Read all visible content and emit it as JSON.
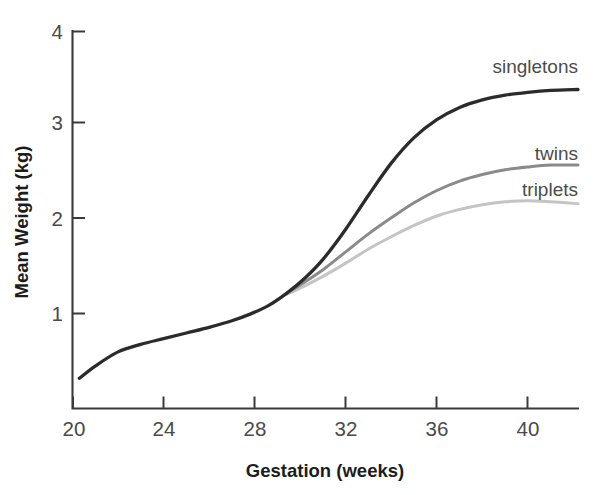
{
  "chart_data": {
    "type": "line",
    "title": "",
    "xlabel": "Gestation (weeks)",
    "ylabel": "Mean Weight (kg)",
    "xlim": [
      20,
      42.2
    ],
    "ylim": [
      0,
      4
    ],
    "grid": false,
    "legend_position": "inline-right-end-of-line",
    "xticks": [
      20,
      24,
      28,
      32,
      36,
      40
    ],
    "xtick_labels": [
      "20",
      "24",
      "28",
      "32",
      "36",
      "40"
    ],
    "yticks": [
      1,
      2,
      3,
      4
    ],
    "ytick_labels": [
      "1",
      "2",
      "3",
      "4"
    ],
    "series": [
      {
        "name": "singletons",
        "color": "#2b2b2b",
        "stroke_width": 3.3,
        "label": "singletons",
        "x": [
          20.3,
          21,
          22,
          23,
          24,
          25,
          26,
          27,
          27.8,
          28.6,
          29.4,
          30.2,
          31,
          32,
          33,
          34,
          35,
          36,
          37,
          38,
          39,
          40,
          41,
          42.2
        ],
        "values": [
          0.32,
          0.45,
          0.6,
          0.68,
          0.74,
          0.8,
          0.86,
          0.93,
          1.0,
          1.09,
          1.22,
          1.38,
          1.58,
          1.9,
          2.26,
          2.6,
          2.87,
          3.06,
          3.19,
          3.27,
          3.32,
          3.35,
          3.37,
          3.38
        ]
      },
      {
        "name": "twins",
        "color": "#8a8a8a",
        "stroke_width": 3.0,
        "label": "twins",
        "x": [
          29.4,
          30.2,
          31,
          32,
          33,
          34,
          35,
          36,
          37,
          38,
          39,
          40,
          41,
          42.2
        ],
        "values": [
          1.22,
          1.34,
          1.47,
          1.66,
          1.85,
          2.02,
          2.18,
          2.31,
          2.41,
          2.48,
          2.53,
          2.56,
          2.58,
          2.58
        ]
      },
      {
        "name": "triplets",
        "color": "#c4c4c4",
        "stroke_width": 3.0,
        "label": "triplets",
        "x": [
          29.4,
          30.2,
          31,
          32,
          33,
          34,
          35,
          36,
          37,
          38,
          39,
          40,
          41,
          42.2
        ],
        "values": [
          1.21,
          1.3,
          1.4,
          1.54,
          1.69,
          1.82,
          1.94,
          2.04,
          2.11,
          2.16,
          2.19,
          2.2,
          2.19,
          2.17
        ]
      }
    ]
  },
  "axes": {
    "y_title": "Mean Weight (kg)",
    "x_title": "Gestation (weeks)",
    "y_tick_labels": [
      "4",
      "3",
      "2",
      "1"
    ],
    "x_tick_labels": [
      "20",
      "24",
      "28",
      "32",
      "36",
      "40"
    ]
  },
  "labels": {
    "singletons": "singletons",
    "twins": "twins",
    "triplets": "triplets"
  },
  "colors": {
    "singletons": "#2b2b2b",
    "twins": "#8a8a8a",
    "triplets": "#c4c4c4",
    "axis": "#3a3a3a",
    "tick_text": "#4a4a4a",
    "title_text": "#1c1c1c",
    "background": "#ffffff"
  }
}
